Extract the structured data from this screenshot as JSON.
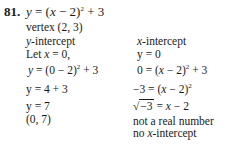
{
  "problem": {
    "number": "81.",
    "equation": {
      "lhs": "y",
      "rhs_base": "(x − 2)",
      "exponent": "2",
      "rhs_tail": " + 3"
    },
    "vertex": "vertex (2, 3)"
  },
  "left_column": {
    "heading_var": "y",
    "heading_rest": "-intercept",
    "let_text": "Let ",
    "let_var": "x",
    "let_rest": " = 0,",
    "step1": {
      "lhs": "y",
      "base": " = (0 − 2)",
      "exp": "2",
      "tail": " + 3"
    },
    "step2": "y = 4 + 3",
    "step3": "y = 7",
    "result": "(0, 7)"
  },
  "right_column": {
    "heading_var": "x",
    "heading_rest": "-intercept",
    "set": "y = 0",
    "step1": {
      "pre": "0 = (",
      "var": "x",
      "mid": " − 2)",
      "exp": "2",
      "tail": " + 3"
    },
    "step2": {
      "pre": "−3 = (",
      "var": "x",
      "mid": " − 2)",
      "exp": "2"
    },
    "step3": {
      "radicand": "−3",
      "eq": " = ",
      "var": "x",
      "tail": " − 2"
    },
    "note1": "not a real number",
    "note2_pre": "no ",
    "note2_var": "x",
    "note2_rest": "-intercept"
  }
}
